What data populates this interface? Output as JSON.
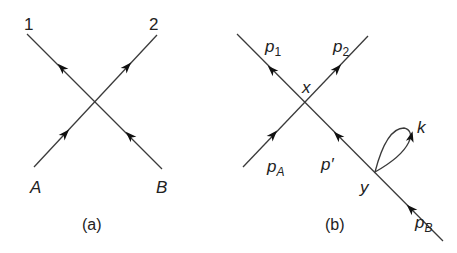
{
  "diagram_a": {
    "caption": "(a)",
    "labels": {
      "out1": "1",
      "out2": "2",
      "inA": "A",
      "inB": "B"
    }
  },
  "diagram_b": {
    "caption": "(b)",
    "labels": {
      "p1_base": "p",
      "p1_sub": "1",
      "p2_base": "p",
      "p2_sub": "2",
      "pA_base": "p",
      "pA_sub": "A",
      "pB_base": "p",
      "pB_sub": "B",
      "pprime": "p′",
      "vertex_x": "x",
      "vertex_y": "y",
      "loop_k": "k"
    }
  },
  "colors": {
    "line": "#3a3a3a",
    "arrow": "#111111",
    "text": "#222222"
  }
}
